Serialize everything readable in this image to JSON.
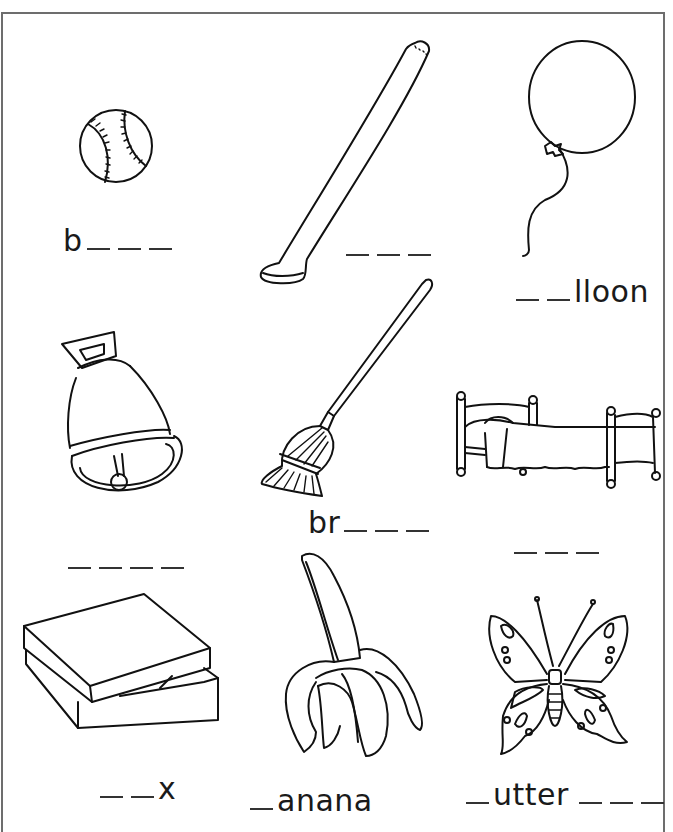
{
  "worksheet": {
    "items": [
      {
        "picture": "baseball",
        "prefix": "b",
        "blanks_before": 0,
        "suffix": "",
        "blanks_after": 3
      },
      {
        "picture": "bat",
        "prefix": "",
        "blanks_before": 3,
        "suffix": "",
        "blanks_after": 0
      },
      {
        "picture": "balloon",
        "prefix": "",
        "blanks_before": 2,
        "suffix": "lloon",
        "blanks_after": 0
      },
      {
        "picture": "bell",
        "prefix": "",
        "blanks_before": 4,
        "suffix": "",
        "blanks_after": 0
      },
      {
        "picture": "broom",
        "prefix": "br",
        "blanks_before": 0,
        "suffix": "",
        "blanks_after": 3
      },
      {
        "picture": "bed",
        "prefix": "",
        "blanks_before": 3,
        "suffix": "",
        "blanks_after": 0
      },
      {
        "picture": "box",
        "prefix": "",
        "blanks_before": 2,
        "suffix": "x",
        "blanks_after": 0
      },
      {
        "picture": "banana",
        "prefix": "",
        "blanks_before": 1,
        "suffix": "anana",
        "blanks_after": 0
      },
      {
        "picture": "butterfly",
        "prefix": "",
        "blanks_before": 1,
        "suffix": "utter",
        "blanks_after": 3
      }
    ],
    "labels": {
      "ball_prefix": "b",
      "balloon_suffix": "lloon",
      "broom_prefix": "br",
      "box_suffix": "x",
      "banana_suffix": "anana",
      "butterfly_suffix": "utter"
    }
  }
}
